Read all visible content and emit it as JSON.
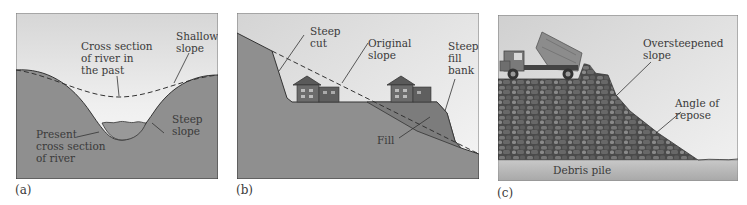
{
  "figure": {
    "panels": [
      {
        "id": "a",
        "letter": "(a)",
        "labels": {
          "past_section": [
            "Cross section",
            "of river in",
            "the past"
          ],
          "shallow_slope": [
            "Shallow",
            "slope"
          ],
          "steep_slope": [
            "Steep",
            "slope"
          ],
          "present_section": [
            "Present",
            "cross section",
            "of river"
          ]
        }
      },
      {
        "id": "b",
        "letter": "(b)",
        "labels": {
          "steep_cut": [
            "Steep",
            "cut"
          ],
          "original_slope": [
            "Original",
            "slope"
          ],
          "steep_fill_bank": [
            "Steep",
            "fill",
            "bank"
          ],
          "fill": [
            "Fill"
          ]
        }
      },
      {
        "id": "c",
        "letter": "(c)",
        "labels": {
          "oversteepened_slope": [
            "Oversteepened",
            "slope"
          ],
          "angle_of_repose": [
            "Angle of",
            "repose"
          ],
          "debris_pile": [
            "Debris pile"
          ]
        }
      }
    ],
    "colors": {
      "sky": "#d9d9d9",
      "sky_light": "#f2f2f2",
      "ground": "#8f8f8f",
      "ground_dark": "#7a7a7a",
      "fill": "#7e7e7e",
      "line": "#333333",
      "rock_dark": "#4a4a4a",
      "rock_mid": "#6e6e6e",
      "rock_light": "#9a9a9a",
      "debris_base": "#b5b5b5"
    }
  }
}
